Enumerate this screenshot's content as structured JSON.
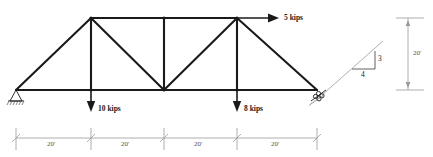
{
  "diagram": {
    "colors": {
      "member": "#1a1a1a",
      "dimension": "#9a9a9a",
      "dimension_text": "#555555",
      "slope_line": "#9a9a9a",
      "background": "#ffffff"
    },
    "loads": [
      {
        "name": "horizontal-load-top-right",
        "label": "5 kips",
        "magnitude": 5,
        "unit": "kips",
        "direction": "right"
      },
      {
        "name": "point-load-left-panel",
        "label": "10 kips",
        "magnitude": 10,
        "unit": "kips",
        "direction": "down"
      },
      {
        "name": "point-load-right-panel",
        "label": "8 kips",
        "magnitude": 8,
        "unit": "kips",
        "direction": "down"
      }
    ],
    "span_dimensions": [
      {
        "label": "20'",
        "value": 20,
        "unit": "ft"
      },
      {
        "label": "20'",
        "value": 20,
        "unit": "ft"
      },
      {
        "label": "20'",
        "value": 20,
        "unit": "ft"
      },
      {
        "label": "20'",
        "value": 20,
        "unit": "ft"
      }
    ],
    "height_dimension": {
      "label": "20'",
      "value": 20,
      "unit": "ft"
    },
    "slope_triangle": {
      "rise_label": "3",
      "run_label": "4",
      "rise": 3,
      "run": 4
    },
    "supports": [
      {
        "name": "pin-support-left",
        "type": "pin"
      },
      {
        "name": "inclined-roller-support-right",
        "type": "inclined-roller"
      }
    ]
  }
}
